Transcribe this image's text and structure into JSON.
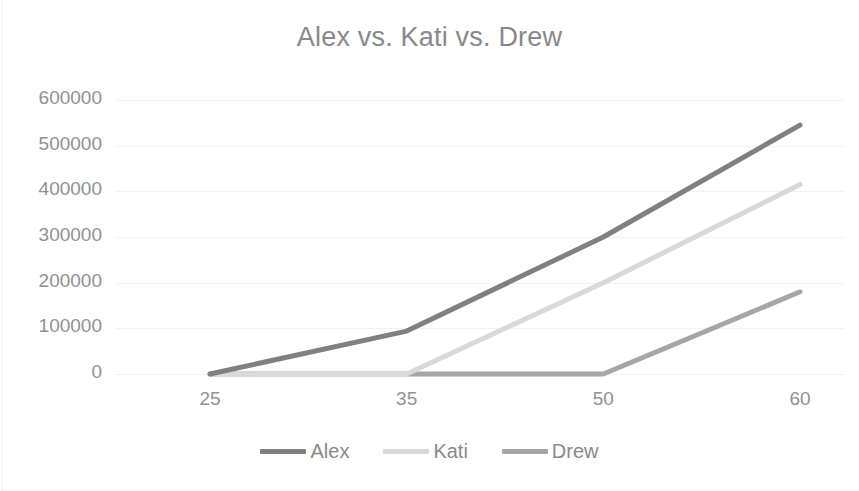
{
  "chart_data": {
    "type": "line",
    "title": "Alex vs. Kati vs. Drew",
    "xlabel": "",
    "ylabel": "",
    "categories": [
      "25",
      "35",
      "50",
      "60"
    ],
    "series": [
      {
        "name": "Alex",
        "color": "#808080",
        "values": [
          0,
          94000,
          300000,
          545000
        ]
      },
      {
        "name": "Kati",
        "color": "#D9D9D9",
        "values": [
          0,
          0,
          200000,
          415000
        ]
      },
      {
        "name": "Drew",
        "color": "#A6A6A6",
        "values": [
          0,
          0,
          0,
          180000
        ]
      }
    ],
    "ylim": [
      0,
      600000
    ],
    "ytick_step": 100000,
    "ytick_labels": [
      "600000",
      "500000",
      "400000",
      "300000",
      "200000",
      "100000",
      "0"
    ],
    "grid": true,
    "grid_color": "#F2F2F2",
    "legend_position": "bottom",
    "title_color": "#898989",
    "tick_label_color": "#919191",
    "background": "#FFFFFF"
  },
  "legend": {
    "items": [
      {
        "label": "Alex",
        "color": "#808080"
      },
      {
        "label": "Kati",
        "color": "#D9D9D9"
      },
      {
        "label": "Drew",
        "color": "#A6A6A6"
      }
    ]
  }
}
